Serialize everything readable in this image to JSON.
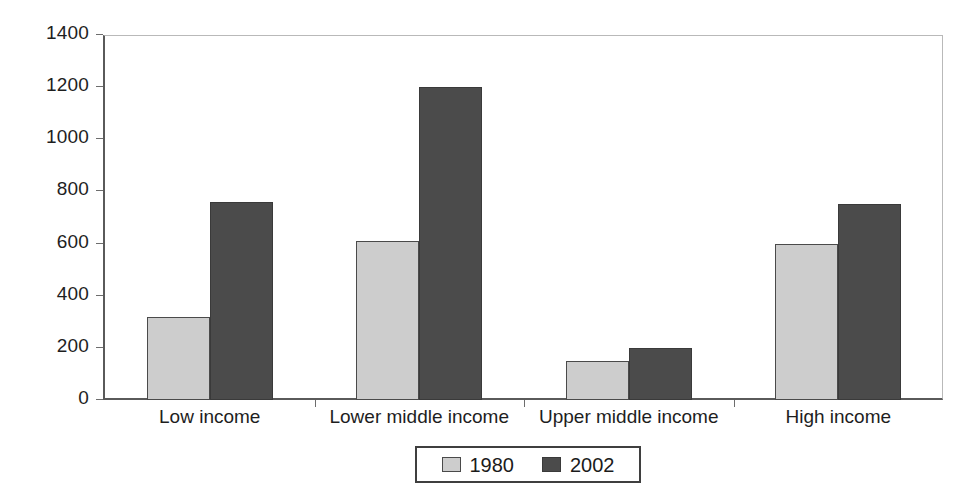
{
  "chart_data": {
    "type": "bar",
    "title": "",
    "subtitle": "",
    "xlabel": "",
    "ylabel": "",
    "categories": [
      "Low income",
      "Lower middle income",
      "Upper middle income",
      "High income"
    ],
    "series": [
      {
        "name": "1980",
        "color": "#cdcdcd",
        "values": [
          320,
          610,
          150,
          600
        ]
      },
      {
        "name": "2002",
        "color": "#4b4b4b",
        "values": [
          760,
          1200,
          200,
          750
        ]
      }
    ],
    "ylim": [
      0,
      1400
    ],
    "y_ticks": [
      0,
      200,
      400,
      600,
      800,
      1000,
      1200,
      1400
    ],
    "y_tick_labels": [
      "0",
      "200",
      "400",
      "600",
      "800",
      "1000",
      "1200",
      "1400"
    ],
    "grid": false,
    "legend": {
      "position": "bottom",
      "entries": [
        {
          "label": "1980",
          "color": "#cdcdcd"
        },
        {
          "label": "2002",
          "color": "#4b4b4b"
        }
      ]
    },
    "axis_colors": {
      "axis_line": "#5a5a5a",
      "tick_mark": "#6d6d6d",
      "text": "#1e1e1e",
      "plot_background": "#ffffff"
    }
  }
}
